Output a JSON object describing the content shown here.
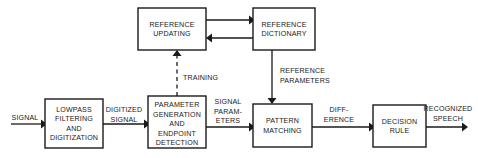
{
  "diagram": {
    "colors": {
      "stroke": "#1a1a1a",
      "box_fill": "#ffffff",
      "background": "#ffffff"
    },
    "blocks": [
      {
        "id": "reference-updating",
        "lines": [
          "REFERENCE",
          "UPDATING"
        ],
        "line1": "REFERENCE",
        "line2": "UPDATING",
        "x": 138,
        "y": 8,
        "w": 68,
        "h": 42
      },
      {
        "id": "reference-dictionary",
        "lines": [
          "REFERENCE",
          "DICTIONARY"
        ],
        "line1": "REFERENCE",
        "line2": "DICTIONARY",
        "x": 253,
        "y": 8,
        "w": 62,
        "h": 42
      },
      {
        "id": "lowpass-filtering-and-digitization",
        "lines": [
          "LOWPASS",
          "FILTERING",
          "AND",
          "DIGITIZATION"
        ],
        "line1": "LOWPASS",
        "line2": "FILTERING",
        "line3": "AND",
        "line4": "DIGITIZATION",
        "x": 45,
        "y": 99,
        "w": 58,
        "h": 49
      },
      {
        "id": "parameter-generation-and-endpoint-detection",
        "lines": [
          "PARAMETER",
          "GENERATION",
          "AND",
          "ENDPOINT",
          "DETECTION"
        ],
        "line1": "PARAMETER",
        "line2": "GENERATION",
        "line3": "AND",
        "line4": "ENDPOINT",
        "line5": "DETECTION",
        "x": 148,
        "y": 96,
        "w": 58,
        "h": 52
      },
      {
        "id": "pattern-matching",
        "lines": [
          "PATTERN",
          "MATCHING"
        ],
        "line1": "PATTERN",
        "line2": "MATCHING",
        "x": 253,
        "y": 104,
        "w": 59,
        "h": 43
      },
      {
        "id": "decision-rule",
        "lines": [
          "DECISION",
          "RULE"
        ],
        "line1": "DECISION",
        "line2": "RULE",
        "x": 373,
        "y": 105,
        "w": 53,
        "h": 42
      }
    ],
    "edge_labels": [
      {
        "id": "signal-input",
        "text": "SIGNAL"
      },
      {
        "id": "digitized-signal",
        "line1": "DIGITIZED",
        "line2": "SIGNAL"
      },
      {
        "id": "signal-parameters",
        "line1": "SIGNAL",
        "line2": "PARAM-",
        "line3": "ETERS"
      },
      {
        "id": "difference",
        "line1": "DIFF-",
        "line2": "ERENCE"
      },
      {
        "id": "recognized-speech",
        "line1": "RECOGNIZED",
        "line2": "SPEECH"
      },
      {
        "id": "training",
        "text": "TRAINING"
      },
      {
        "id": "reference-parameters",
        "line1": "REFERENCE",
        "line2": "PARAMETERS"
      }
    ],
    "connections": [
      {
        "id": "signal-to-lowpass",
        "style": "solid",
        "arrow": "right"
      },
      {
        "id": "lowpass-to-parameter-generation",
        "style": "solid",
        "arrow": "right"
      },
      {
        "id": "parameter-generation-to-pattern-matching",
        "style": "solid",
        "arrow": "right"
      },
      {
        "id": "pattern-matching-to-decision-rule",
        "style": "solid",
        "arrow": "right"
      },
      {
        "id": "decision-rule-to-recognized-speech",
        "style": "solid",
        "arrow": "right"
      },
      {
        "id": "training-to-reference-updating",
        "style": "dashed",
        "arrow": "up"
      },
      {
        "id": "reference-updating-to-reference-dictionary",
        "style": "solid",
        "arrow": "right"
      },
      {
        "id": "reference-dictionary-to-reference-updating",
        "style": "solid",
        "arrow": "left"
      },
      {
        "id": "reference-dictionary-to-pattern-matching",
        "style": "solid",
        "arrow": "down"
      }
    ]
  }
}
